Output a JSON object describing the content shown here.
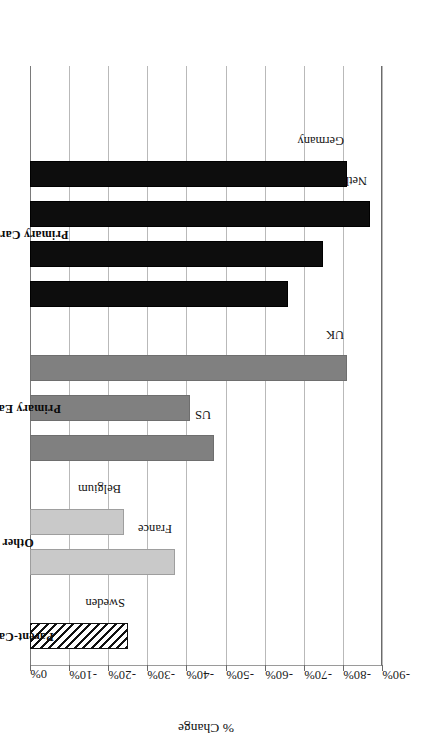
{
  "chart_data": {
    "type": "bar",
    "title": "",
    "xlabel": "",
    "ylabel": "% Change",
    "ylim": [
      -90,
      0
    ],
    "orientation": "vertical-bars-rotated",
    "grid": true,
    "legend_position": "none",
    "tick_labels": [
      "0%",
      "-10%",
      "-20%",
      "-30%",
      "-40%",
      "-50%",
      "-60%",
      "-70%",
      "-80%",
      "-90%"
    ],
    "tick_values": [
      0,
      -10,
      -20,
      -30,
      -40,
      -50,
      -60,
      -70,
      -80,
      -90
    ],
    "groups": [
      {
        "name": "Primary Caregiver",
        "fill": "black",
        "color": "#0d0d0d",
        "points": [
          {
            "category": "Germany",
            "value": -81
          },
          {
            "category": "Netherlands",
            "value": -87
          },
          {
            "category": "Luxembourg",
            "value": -75
          },
          {
            "category": "Austria",
            "value": -66
          }
        ]
      },
      {
        "name": "Primary Earner",
        "fill": "gray",
        "color": "#808080",
        "points": [
          {
            "category": "UK",
            "value": -81
          },
          {
            "category": "Canada",
            "value": -41
          },
          {
            "category": "US",
            "value": -47
          }
        ]
      },
      {
        "name": "Other",
        "fill": "lightgray",
        "color": "#c9c9c9",
        "points": [
          {
            "category": "Belgium",
            "value": -24
          },
          {
            "category": "France",
            "value": -37
          }
        ]
      },
      {
        "name": "Parent-Carer",
        "fill": "hatch",
        "color": "#ffffff",
        "points": [
          {
            "category": "Sweden",
            "value": -25
          }
        ]
      }
    ],
    "categories": [
      "Germany",
      "Netherlands",
      "Luxembourg",
      "Austria",
      "UK",
      "Canada",
      "US",
      "Belgium",
      "France",
      "Sweden"
    ],
    "values": [
      -81,
      -87,
      -75,
      -66,
      -81,
      -41,
      -47,
      -24,
      -37,
      -25
    ]
  }
}
